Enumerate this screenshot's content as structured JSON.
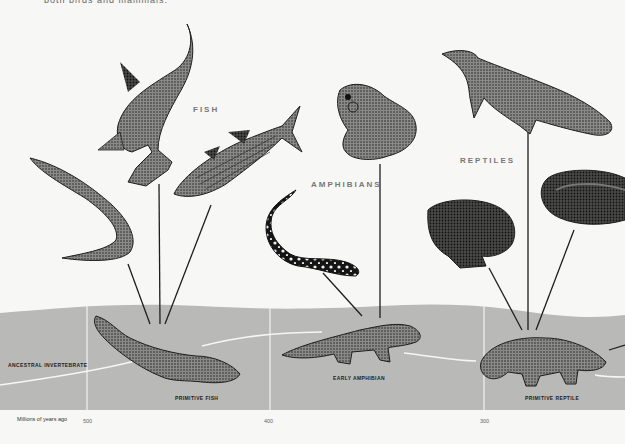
{
  "caption_top": "both birds and mammals.",
  "groups": [
    {
      "id": "fish",
      "label": "FISH"
    },
    {
      "id": "amphibians",
      "label": "AMPHIBIANS"
    },
    {
      "id": "reptiles",
      "label": "REPTILES"
    }
  ],
  "stages": [
    {
      "id": "ancestral-invertebrate",
      "label": "ANCESTRAL INVERTEBRATE"
    },
    {
      "id": "primitive-fish",
      "label": "PRIMITIVE FISH"
    },
    {
      "id": "early-amphibian",
      "label": "EARLY AMPHIBIAN"
    },
    {
      "id": "primitive-reptile",
      "label": "PRIMITIVE REPTILE"
    }
  ],
  "axis": {
    "title": "Millions of years ago",
    "ticks": [
      "500",
      "400",
      "300"
    ]
  },
  "animals": {
    "fish": [
      "eel",
      "hammerhead shark",
      "striped bass"
    ],
    "amphibians": [
      "frog",
      "spotted salamander"
    ],
    "reptiles": [
      "crocodile",
      "turtle",
      "snake"
    ]
  },
  "colors": {
    "background": "#f7f7f5",
    "band": "#b9b9b7",
    "divider": "#f2f2f0",
    "ink": "#1e1e1e"
  }
}
